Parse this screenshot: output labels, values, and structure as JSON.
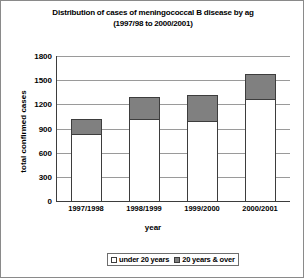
{
  "chart_data": {
    "type": "bar",
    "title": "Distribution of cases of meningococcal B disease by ag",
    "subtitle": "(1997/98 to 2000/2001)",
    "xlabel": "year",
    "ylabel": "total confirmed cases",
    "categories": [
      "1997/1998",
      "1998/1999",
      "1999/2000",
      "2000/2001"
    ],
    "series": [
      {
        "name": "under 20 years",
        "color": "#ffffff",
        "values": [
          820,
          1000,
          980,
          1250
        ]
      },
      {
        "name": "20 years & over",
        "color": "#808080",
        "values": [
          180,
          280,
          320,
          320
        ]
      }
    ],
    "totals": [
      1000,
      1280,
      1300,
      1570
    ],
    "ylim": [
      0,
      1800
    ],
    "yticks": [
      1800,
      1500,
      1200,
      900,
      600,
      300,
      0
    ],
    "grid": true,
    "stacked": true,
    "legend_position": "bottom"
  },
  "legend": {
    "items": [
      {
        "label": "under 20 years",
        "swatch": "white-square-icon"
      },
      {
        "label": "20 years & over",
        "swatch": "gray-square-icon"
      }
    ]
  }
}
